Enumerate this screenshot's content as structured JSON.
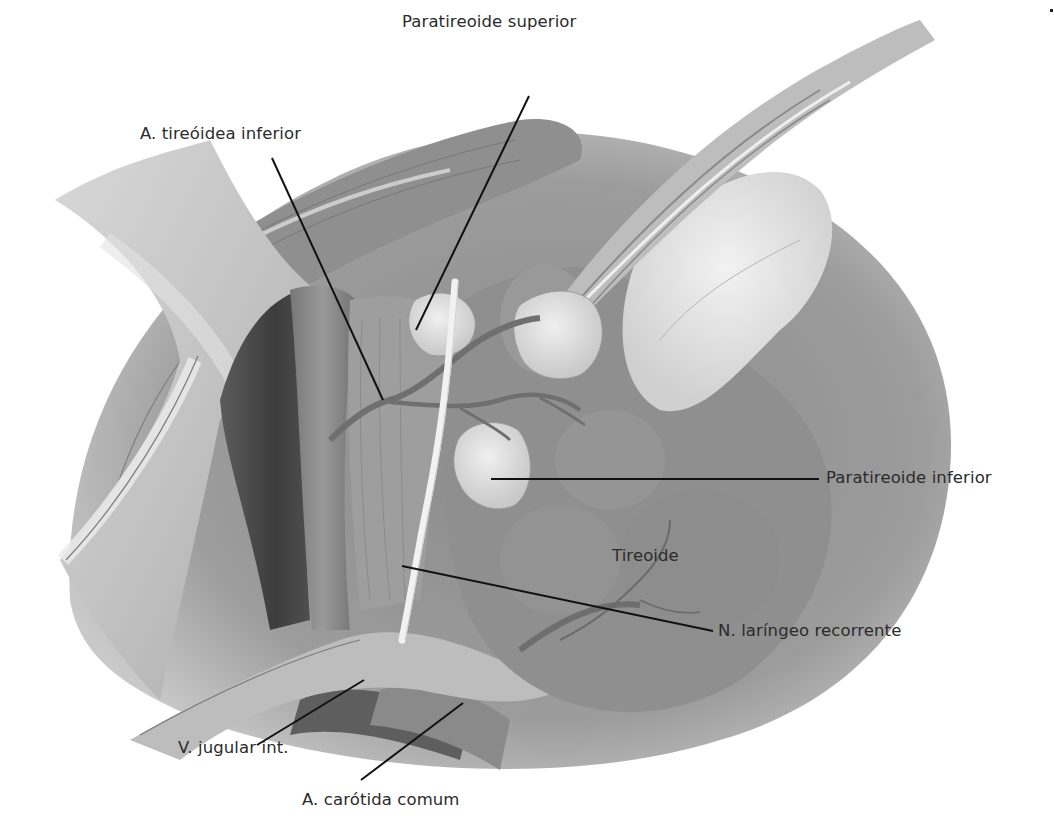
{
  "figure": {
    "palette": {
      "background": "#ffffff",
      "tissue_dark": "#6e6e6e",
      "tissue_mid": "#9a9a9a",
      "tissue_light": "#bdbdbd",
      "gland_fill": "#dcdcdc",
      "vessel_dark": "#4a4a4a",
      "nerve": "#f4f4f4",
      "leader_line": "#111111",
      "label_text": "#2b2b2b"
    }
  },
  "labels": [
    {
      "id": "paratireoide-superior",
      "text": "Paratireoide superior",
      "x": 402,
      "y": 14,
      "line": [
        529,
        96,
        416,
        330
      ]
    },
    {
      "id": "a-tireoidea-inferior",
      "text": "A. tireóidea inferior",
      "x": 140,
      "y": 126,
      "line": [
        272,
        158,
        383,
        400
      ]
    },
    {
      "id": "paratireoide-inferior",
      "text": "Paratireoide inferior",
      "x": 826,
      "y": 470,
      "line": [
        491,
        479,
        819,
        479
      ]
    },
    {
      "id": "tireoide",
      "text": "Tireoide",
      "x": 612,
      "y": 548,
      "line": null
    },
    {
      "id": "n-laringeo-recorrente",
      "text": "N. laríngeo recorrente",
      "x": 718,
      "y": 623,
      "line": [
        402,
        566,
        713,
        631
      ]
    },
    {
      "id": "v-jugular-int",
      "text": "V. jugular int.",
      "x": 178,
      "y": 740,
      "line": [
        364,
        680,
        257,
        745
      ]
    },
    {
      "id": "a-carotida-comum",
      "text": "A. carótida comum",
      "x": 302,
      "y": 792,
      "line": [
        463,
        703,
        361,
        780
      ]
    }
  ]
}
